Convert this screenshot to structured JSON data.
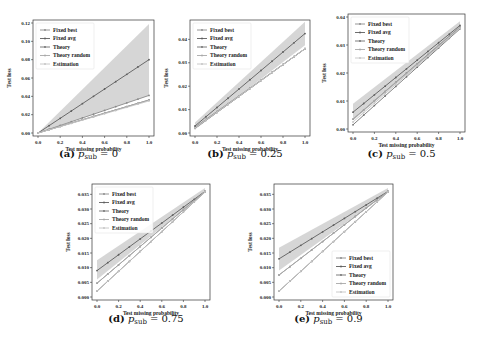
{
  "chart_data": [
    {
      "id": "a",
      "type": "line",
      "caption_prefix": "(a)",
      "caption_var": "p",
      "caption_sub": "sub",
      "caption_value": "= 0",
      "xlabel": "Test missing probability",
      "ylabel": "Test loss",
      "xlim": [
        0.0,
        1.0
      ],
      "ylim": [
        0.0,
        0.12
      ],
      "xticks": [
        "0.0",
        "0.2",
        "0.4",
        "0.6",
        "0.8",
        "1.0"
      ],
      "yticks": [
        "0.00",
        "0.02",
        "0.04",
        "0.06",
        "0.08",
        "0.10",
        "0.12"
      ],
      "legend_position": "top-left",
      "x": [
        0.0,
        0.1,
        0.2,
        0.3,
        0.4,
        0.5,
        0.6,
        0.7,
        0.8,
        0.9,
        1.0
      ],
      "series": [
        {
          "name": "Fixed best",
          "color": "#8a8a8a",
          "y0": 0.0,
          "y1": 0.041
        },
        {
          "name": "Fixed avg",
          "color": "#5e5e5e",
          "y0": 0.0,
          "y1": 0.08,
          "band": [
            0.0,
            0.0,
            0.041,
            0.119
          ]
        },
        {
          "name": "Theory",
          "color": "#707070",
          "y0": 0.0,
          "y1": 0.036
        },
        {
          "name": "Theory random",
          "color": "#a8a8a8",
          "y0": 0.0,
          "y1": 0.036
        },
        {
          "name": "Estimation",
          "color": "#c4c4c4",
          "y0": 0.0,
          "y1": 0.035
        }
      ]
    },
    {
      "id": "b",
      "type": "line",
      "caption_prefix": "(b)",
      "caption_var": "p",
      "caption_sub": "sub",
      "caption_value": "= 0.25",
      "xlabel": "Test missing probability",
      "ylabel": "Test loss",
      "xlim": [
        0.0,
        1.0
      ],
      "ylim": [
        0.0,
        0.047
      ],
      "xticks": [
        "0.0",
        "0.2",
        "0.4",
        "0.6",
        "0.8",
        "1.0"
      ],
      "yticks": [
        "0.00",
        "0.01",
        "0.02",
        "0.03",
        "0.04"
      ],
      "ytick_values": [
        0.0,
        0.01,
        0.02,
        0.03,
        0.04
      ],
      "legend_position": "top-left",
      "x": [
        0.0,
        0.1,
        0.2,
        0.3,
        0.4,
        0.5,
        0.6,
        0.7,
        0.8,
        0.9,
        1.0
      ],
      "series": [
        {
          "name": "Fixed best",
          "color": "#8a8a8a",
          "y0": 0.0025,
          "y1": 0.036
        },
        {
          "name": "Fixed avg",
          "color": "#5e5e5e",
          "y0": 0.003,
          "y1": 0.0425,
          "band": [
            0.0015,
            0.0045,
            0.0375,
            0.0475
          ]
        },
        {
          "name": "Theory",
          "color": "#707070",
          "y0": 0.002,
          "y1": 0.036
        },
        {
          "name": "Theory random",
          "color": "#a8a8a8",
          "y0": 0.002,
          "y1": 0.036
        },
        {
          "name": "Estimation",
          "color": "#c4c4c4",
          "y0": 0.0022,
          "y1": 0.036
        }
      ]
    },
    {
      "id": "c",
      "type": "line",
      "caption_prefix": "(c)",
      "caption_var": "p",
      "caption_sub": "sub",
      "caption_value": "= 0.5",
      "xlabel": "Test missing probability",
      "ylabel": "Test loss",
      "xlim": [
        0.0,
        1.0
      ],
      "ylim": [
        0.0,
        0.04
      ],
      "xticks": [
        "0.0",
        "0.2",
        "0.4",
        "0.6",
        "0.8",
        "1.0"
      ],
      "yticks": [
        "0.00",
        "0.01",
        "0.02",
        "0.03",
        "0.04"
      ],
      "ytick_values": [
        0.0,
        0.01,
        0.02,
        0.03,
        0.04
      ],
      "legend_position": "top-left",
      "x": [
        0.0,
        0.1,
        0.2,
        0.3,
        0.4,
        0.5,
        0.6,
        0.7,
        0.8,
        0.9,
        1.0
      ],
      "series": [
        {
          "name": "Fixed best",
          "color": "#8a8a8a",
          "y0": 0.0035,
          "y1": 0.0365
        },
        {
          "name": "Fixed avg",
          "color": "#5e5e5e",
          "y0": 0.006,
          "y1": 0.037,
          "band": [
            0.003,
            0.009,
            0.0355,
            0.0385
          ]
        },
        {
          "name": "Theory",
          "color": "#707070",
          "y0": 0.0015,
          "y1": 0.0358
        },
        {
          "name": "Theory random",
          "color": "#a8a8a8",
          "y0": 0.0035,
          "y1": 0.0362
        },
        {
          "name": "Estimation",
          "color": "#c4c4c4",
          "y0": 0.0025,
          "y1": 0.036
        }
      ]
    },
    {
      "id": "d",
      "type": "line",
      "caption_prefix": "(d)",
      "caption_var": "p",
      "caption_sub": "sub",
      "caption_value": "= 0.75",
      "xlabel": "Test missing probability",
      "ylabel": "Test loss",
      "xlim": [
        0.0,
        1.0
      ],
      "ylim": [
        0.0,
        0.0375
      ],
      "xticks": [
        "0.0",
        "0.2",
        "0.4",
        "0.6",
        "0.8",
        "1.0"
      ],
      "yticks": [
        "0.000",
        "0.005",
        "0.010",
        "0.015",
        "0.020",
        "0.025",
        "0.030",
        "0.035"
      ],
      "ytick_values": [
        0.0,
        0.005,
        0.01,
        0.015,
        0.02,
        0.025,
        0.03,
        0.035
      ],
      "legend_position": "top-left",
      "x": [
        0.0,
        0.1,
        0.2,
        0.3,
        0.4,
        0.5,
        0.6,
        0.7,
        0.8,
        0.9,
        1.0
      ],
      "series": [
        {
          "name": "Fixed best",
          "color": "#8a8a8a",
          "y0": 0.0047,
          "y1": 0.036
        },
        {
          "name": "Fixed avg",
          "color": "#5e5e5e",
          "y0": 0.009,
          "y1": 0.036,
          "band": [
            0.006,
            0.0125,
            0.0355,
            0.0372
          ]
        },
        {
          "name": "Theory",
          "color": "#707070",
          "y0": 0.002,
          "y1": 0.0358
        },
        {
          "name": "Theory random",
          "color": "#a8a8a8",
          "y0": 0.0047,
          "y1": 0.036
        },
        {
          "name": "Estimation",
          "color": "#c4c4c4",
          "y0": 0.002,
          "y1": 0.0358
        }
      ]
    },
    {
      "id": "e",
      "type": "line",
      "caption_prefix": "(e)",
      "caption_var": "p",
      "caption_sub": "sub",
      "caption_value": "= 0.9",
      "xlabel": "Test missing probability",
      "ylabel": "Test loss",
      "xlim": [
        0.0,
        1.0
      ],
      "ylim": [
        0.0,
        0.0375
      ],
      "xticks": [
        "0.0",
        "0.2",
        "0.4",
        "0.6",
        "0.8",
        "1.0"
      ],
      "yticks": [
        "0.000",
        "0.005",
        "0.010",
        "0.015",
        "0.020",
        "0.025",
        "0.030",
        "0.035"
      ],
      "ytick_values": [
        0.0,
        0.005,
        0.01,
        0.015,
        0.02,
        0.025,
        0.03,
        0.035
      ],
      "legend_position": "bottom-right",
      "x": [
        0.0,
        0.1,
        0.2,
        0.3,
        0.4,
        0.5,
        0.6,
        0.7,
        0.8,
        0.9,
        1.0
      ],
      "series": [
        {
          "name": "Fixed best",
          "color": "#8a8a8a",
          "y0": 0.0075,
          "y1": 0.036
        },
        {
          "name": "Fixed avg",
          "color": "#5e5e5e",
          "y0": 0.013,
          "y1": 0.036,
          "band": [
            0.009,
            0.0168,
            0.0355,
            0.0372
          ]
        },
        {
          "name": "Theory",
          "color": "#707070",
          "y0": 0.002,
          "y1": 0.0358
        },
        {
          "name": "Theory random",
          "color": "#a8a8a8",
          "y0": 0.0075,
          "y1": 0.036
        },
        {
          "name": "Estimation",
          "color": "#c4c4c4",
          "y0": 0.002,
          "y1": 0.0358
        }
      ]
    }
  ]
}
